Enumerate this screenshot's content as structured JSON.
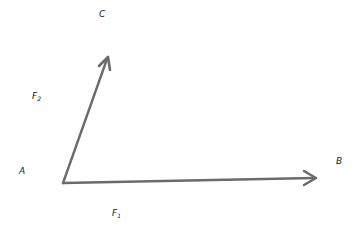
{
  "diagram": {
    "type": "vector-diagram",
    "stroke_color": "#6b6b6b",
    "points": {
      "A": {
        "label": "A",
        "x": 63,
        "y": 183
      },
      "B": {
        "label": "B",
        "x": 316,
        "y": 178
      },
      "C": {
        "label": "C",
        "x": 108,
        "y": 57
      }
    },
    "vectors": [
      {
        "name": "F1",
        "label_main": "F",
        "label_sub": "1",
        "from": "A",
        "to": "B"
      },
      {
        "name": "F2",
        "label_main": "F",
        "label_sub": "2",
        "from": "A",
        "to": "C"
      }
    ],
    "labels": {
      "A": "A",
      "B": "B",
      "C": "C",
      "F1_main": "F",
      "F1_sub": "1",
      "F2_main": "F",
      "F2_sub": "2"
    }
  }
}
